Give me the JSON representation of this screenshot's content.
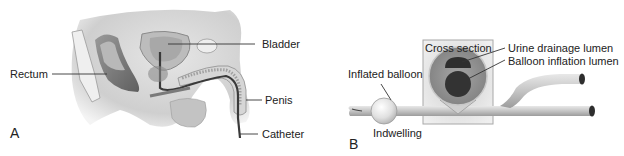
{
  "panel_a": {
    "letter": "A",
    "labels": {
      "bladder": "Bladder",
      "rectum": "Rectum",
      "penis": "Penis",
      "catheter": "Catheter"
    }
  },
  "panel_b": {
    "letter": "B",
    "labels": {
      "cross_section": "Cross section",
      "urine_drainage_lumen": "Urine drainage lumen",
      "balloon_inflation_lumen": "Balloon inflation lumen",
      "inflated_balloon": "Inflated balloon",
      "indwelling": "Indwelling"
    }
  },
  "colors": {
    "background": "#ffffff",
    "tissue_light": "#d9d9d9",
    "tissue_mid": "#b5b5b5",
    "tissue_dark": "#6e6e6e",
    "catheter_tube": "#c8c8c8",
    "lumen_dark": "#2e2e2e",
    "leader_line": "#333333",
    "text": "#222222"
  }
}
